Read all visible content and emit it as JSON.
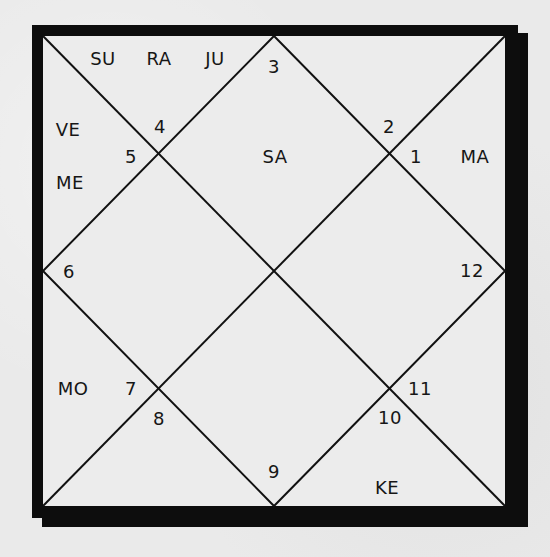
{
  "chart": {
    "type": "north-indian-birth-chart",
    "line_color": "#111111",
    "frame_color": "#0d0d0d",
    "background_color": "#eaeaea",
    "houses": [
      {
        "number": "1",
        "x": 416,
        "y": 157,
        "planets": [
          {
            "name": "MA",
            "x": 475,
            "y": 157
          }
        ]
      },
      {
        "number": "2",
        "x": 389,
        "y": 127,
        "planets": []
      },
      {
        "number": "3",
        "x": 274,
        "y": 67,
        "planets": []
      },
      {
        "number": "4",
        "x": 160,
        "y": 127,
        "planets": [
          {
            "name": "SU",
            "x": 103,
            "y": 59
          },
          {
            "name": "RA",
            "x": 159,
            "y": 59
          },
          {
            "name": "JU",
            "x": 215,
            "y": 59
          }
        ]
      },
      {
        "number": "5",
        "x": 131,
        "y": 157,
        "planets": [
          {
            "name": "VE",
            "x": 68,
            "y": 130
          },
          {
            "name": "ME",
            "x": 70,
            "y": 183
          }
        ]
      },
      {
        "number": "6",
        "x": 69,
        "y": 272,
        "planets": []
      },
      {
        "number": "7",
        "x": 131,
        "y": 389,
        "planets": [
          {
            "name": "MO",
            "x": 73,
            "y": 389
          }
        ]
      },
      {
        "number": "8",
        "x": 159,
        "y": 419,
        "planets": []
      },
      {
        "number": "9",
        "x": 274,
        "y": 472,
        "planets": []
      },
      {
        "number": "10",
        "x": 390,
        "y": 418,
        "planets": [
          {
            "name": "KE",
            "x": 387,
            "y": 488
          }
        ]
      },
      {
        "number": "11",
        "x": 420,
        "y": 389,
        "planets": []
      },
      {
        "number": "12",
        "x": 472,
        "y": 271,
        "planets": []
      }
    ],
    "center_planets": [
      {
        "name": "SA",
        "x": 275,
        "y": 157
      }
    ]
  }
}
